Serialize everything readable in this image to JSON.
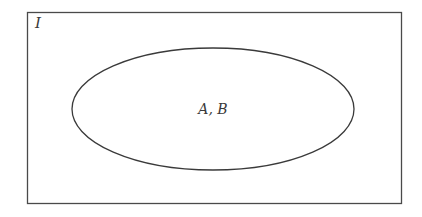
{
  "diagram": {
    "type": "venn",
    "universal_set": {
      "label": "I",
      "rect": {
        "x": 27,
        "y": 12,
        "width": 374,
        "height": 191
      }
    },
    "sets": [
      {
        "label": "A, B",
        "shape": "ellipse",
        "cx": 213,
        "cy": 109,
        "rx": 141,
        "ry": 61
      }
    ],
    "colors": {
      "stroke": "#3a3a3a",
      "background": "#ffffff",
      "text": "#3a3a3a"
    }
  }
}
